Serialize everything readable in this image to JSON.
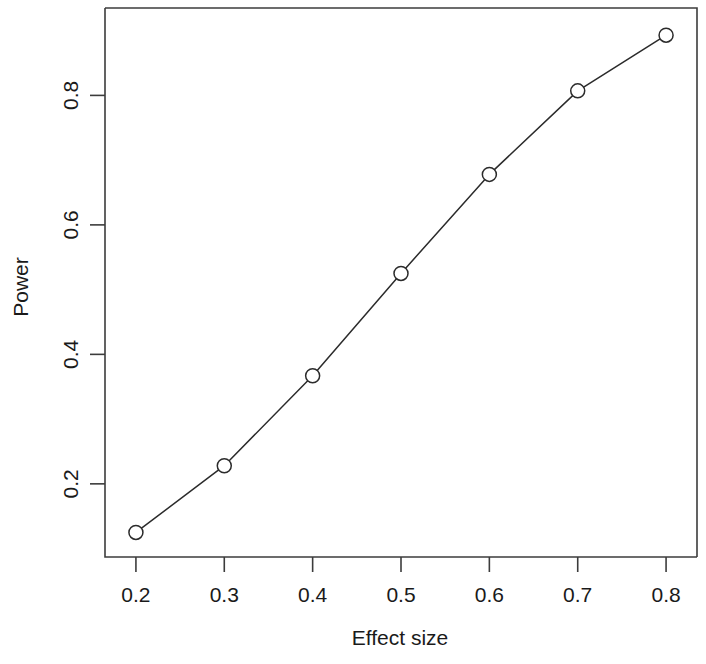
{
  "chart_data": {
    "type": "line",
    "title": "",
    "subtitle": "",
    "xlabel": "Effect size",
    "ylabel": "Power",
    "x": [
      0.2,
      0.3,
      0.4,
      0.5,
      0.6,
      0.7,
      0.8
    ],
    "values": [
      0.125,
      0.228,
      0.367,
      0.525,
      0.678,
      0.807,
      0.893
    ],
    "series": [
      {
        "name": "Power",
        "x": [
          0.2,
          0.3,
          0.4,
          0.5,
          0.6,
          0.7,
          0.8
        ],
        "values": [
          0.125,
          0.228,
          0.367,
          0.525,
          0.678,
          0.807,
          0.893
        ]
      }
    ],
    "xlim": [
      0.165,
      0.835
    ],
    "ylim": [
      0.087,
      0.935
    ],
    "xticks": [
      0.2,
      0.3,
      0.4,
      0.5,
      0.6,
      0.7,
      0.8
    ],
    "xtick_labels": [
      "0.2",
      "0.3",
      "0.4",
      "0.5",
      "0.6",
      "0.7",
      "0.8"
    ],
    "yticks": [
      0.2,
      0.4,
      0.6,
      0.8
    ],
    "ytick_labels": [
      "0.2",
      "0.4",
      "0.6",
      "0.8"
    ],
    "grid": false,
    "legend": false,
    "legend_position": "none",
    "marker": "open-circle",
    "line_color": "#2b2b2b",
    "marker_fill": "#ffffff",
    "background_color": "#ffffff",
    "axis_color": "#3c3c3c",
    "annotations": []
  }
}
